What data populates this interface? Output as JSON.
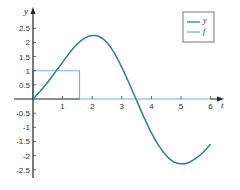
{
  "chart_data": {
    "type": "line",
    "title": "",
    "xlabel": "t",
    "ylabel": "y",
    "xlim": [
      0,
      6.35
    ],
    "ylim": [
      -2.85,
      2.85
    ],
    "grid": false,
    "legend_position": "upper right",
    "x_ticks": [
      1,
      2,
      3,
      4,
      5,
      6
    ],
    "x_tick_labels": [
      "1",
      "2",
      "3",
      "4",
      "5",
      "6"
    ],
    "y_ticks": [
      2.5,
      2,
      1.5,
      1,
      0.5,
      -0.5,
      -1,
      -1.5,
      -2,
      -2.5
    ],
    "y_tick_labels": [
      "2.5",
      "2",
      "1.5",
      "1",
      "0.5",
      "-0.5",
      "-1",
      "-1.5",
      "-2",
      "-2.5"
    ],
    "series": [
      {
        "name": "y",
        "color": "#2f7f8f",
        "x": [
          0,
          0.25,
          0.5,
          0.75,
          1.0,
          1.25,
          1.5,
          1.75,
          2.0,
          2.25,
          2.5,
          2.75,
          3.0,
          3.25,
          3.5,
          3.75,
          4.0,
          4.25,
          4.5,
          4.75,
          5.0,
          5.25,
          5.5,
          5.75,
          6.0
        ],
        "values": [
          0,
          0.28,
          0.6,
          0.95,
          1.3,
          1.65,
          1.95,
          2.15,
          2.24,
          2.2,
          2.0,
          1.62,
          1.12,
          0.55,
          -0.05,
          -0.65,
          -1.2,
          -1.65,
          -2.0,
          -2.22,
          -2.29,
          -2.25,
          -2.1,
          -1.88,
          -1.6
        ]
      },
      {
        "name": "f",
        "color": "#6fb3cc",
        "x": [
          0,
          0,
          1.5708,
          1.5708,
          6.0
        ],
        "values": [
          0,
          1,
          1,
          0,
          0
        ]
      }
    ]
  },
  "legend": {
    "items": [
      {
        "label": "y",
        "color": "#2f7f8f"
      },
      {
        "label": "f",
        "color": "#6fb3cc"
      }
    ]
  },
  "axes": {
    "x_label": "t",
    "y_label": "y"
  }
}
